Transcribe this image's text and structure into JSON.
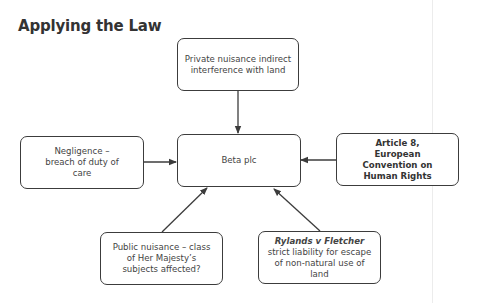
{
  "title": "Applying the Law",
  "diagram": {
    "center": {
      "label": "Beta plc"
    },
    "nodes": {
      "top": {
        "label": "Private nuisance indirect interference with land"
      },
      "left": {
        "label": "Negligence – breach of duty of care"
      },
      "right": {
        "label": "Article 8, European Convention on Human Rights"
      },
      "bottom_left": {
        "label": "Public nuisance – class of Her Majesty’s subjects affected?"
      },
      "bottom_right": {
        "label_em": "Rylands v Fletcher",
        "label_rest": " strict liability for escape of non-natural use of land"
      }
    },
    "edges": [
      {
        "from": "top",
        "to": "center"
      },
      {
        "from": "left",
        "to": "center"
      },
      {
        "from": "right",
        "to": "center"
      },
      {
        "from": "bottom_left",
        "to": "center"
      },
      {
        "from": "bottom_right",
        "to": "center"
      }
    ],
    "colors": {
      "stroke": "#3c3c3c",
      "text": "#444444",
      "background": "#ffffff"
    }
  }
}
